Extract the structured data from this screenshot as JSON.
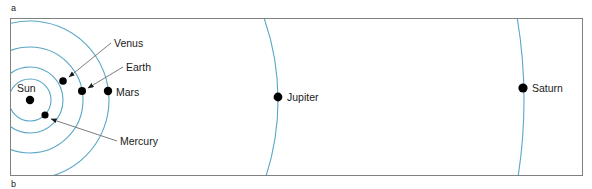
{
  "figure": {
    "panel_labels": {
      "a": "a",
      "b": "b"
    },
    "frame": {
      "x": 10,
      "y": 18,
      "width": 573,
      "height": 158,
      "border_color": "#808080",
      "fill_color": "#ffffff"
    },
    "orbit_color": "#5aa7c6",
    "body_color": "#000000",
    "leader_color": "#6e6e6e"
  },
  "chart_data": {
    "type": "scatter",
    "title": "",
    "subtitle": "",
    "xlabel": "",
    "ylabel": "",
    "center": {
      "name": "Sun",
      "x": 30,
      "y": 100,
      "radius": 4.2
    },
    "bodies": [
      {
        "name": "Mercury",
        "x": 45,
        "y": 115,
        "radius": 3.6,
        "orbit_radius": 21
      },
      {
        "name": "Venus",
        "x": 63,
        "y": 81,
        "radius": 3.8,
        "orbit_radius": 33
      },
      {
        "name": "Earth",
        "x": 82,
        "y": 91,
        "radius": 4.0,
        "orbit_radius": 53
      },
      {
        "name": "Mars",
        "x": 108,
        "y": 91,
        "radius": 4.2,
        "orbit_radius": 79
      },
      {
        "name": "Jupiter",
        "x": 278,
        "y": 97,
        "radius": 4.4,
        "orbit_radius": 248
      },
      {
        "name": "Saturn",
        "x": 523,
        "y": 88,
        "radius": 4.6,
        "orbit_radius": 494
      }
    ],
    "labels": [
      {
        "text": "Venus",
        "x": 114,
        "y": 47,
        "anchor": "start"
      },
      {
        "text": "Earth",
        "x": 126,
        "y": 71,
        "anchor": "start"
      },
      {
        "text": "Mars",
        "x": 116,
        "y": 96,
        "anchor": "start"
      },
      {
        "text": "Mercury",
        "x": 120,
        "y": 145,
        "anchor": "start"
      },
      {
        "text": "Jupiter",
        "x": 287,
        "y": 101,
        "anchor": "start"
      },
      {
        "text": "Saturn",
        "x": 532,
        "y": 92,
        "anchor": "start"
      }
    ],
    "leaders": [
      {
        "for": "Venus",
        "x1": 111,
        "y1": 43,
        "x2": 69,
        "y2": 77
      },
      {
        "for": "Earth",
        "x1": 123,
        "y1": 67,
        "x2": 88,
        "y2": 88
      },
      {
        "for": "Mercury",
        "x1": 117,
        "y1": 141,
        "x2": 51,
        "y2": 119
      }
    ],
    "grid": false,
    "legend": "none"
  }
}
